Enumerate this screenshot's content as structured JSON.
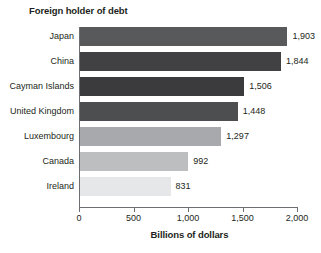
{
  "chart_data": {
    "type": "bar",
    "orientation": "horizontal",
    "title": "Foreign holder of debt",
    "xlabel": "Billions of dollars",
    "ylabel": "",
    "xlim": [
      0,
      2000
    ],
    "xticks": [
      0,
      500,
      1000,
      1500,
      2000
    ],
    "xtick_labels": [
      "0",
      "500",
      "1,000",
      "1,500",
      "2,000"
    ],
    "grid": false,
    "legend": null,
    "categories": [
      "Japan",
      "China",
      "Cayman Islands",
      "United Kingdom",
      "Luxembourg",
      "Canada",
      "Ireland"
    ],
    "values": [
      1903,
      1844,
      1506,
      1448,
      1297,
      992,
      831
    ],
    "value_labels": [
      "1,903",
      "1,844",
      "1,506",
      "1,448",
      "1,297",
      "992",
      "831"
    ],
    "bar_colors": [
      "#58595b",
      "#414042",
      "#3b3a3c",
      "#4d4e50",
      "#a7a9ac",
      "#bcbec0",
      "#e6e7e8"
    ]
  },
  "axis": {
    "line_color": "#6d6e71"
  }
}
